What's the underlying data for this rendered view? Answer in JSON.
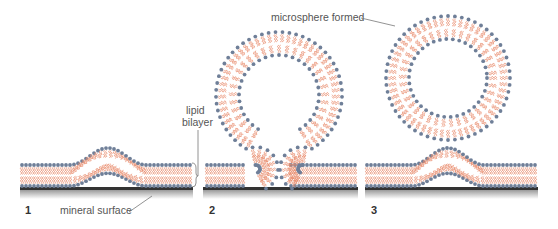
{
  "figure": {
    "labels": {
      "lipid_bilayer_line1": "lipid",
      "lipid_bilayer_line2": "bilayer",
      "mineral_surface": "mineral surface",
      "microsphere_formed": "microsphere formed"
    },
    "panels": [
      {
        "number": "1",
        "stage": "bilayer bulging from mineral surface"
      },
      {
        "number": "2",
        "stage": "bilayer forming omega-shaped bud"
      },
      {
        "number": "3",
        "stage": "microsphere pinched off, bilayer remains on surface"
      }
    ],
    "colors": {
      "lipid_head": "#6f7f98",
      "lipid_tail": "#e8896a",
      "surface": "#3a3a3a",
      "surface_shadow": "#c8c8c8",
      "label_text": "#555555",
      "leader_line": "#777777"
    }
  }
}
